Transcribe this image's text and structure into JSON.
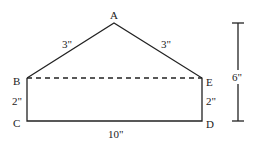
{
  "figure": {
    "vertices": [
      {
        "label": "A",
        "x": 114,
        "y": 23
      },
      {
        "label": "B",
        "x": 27,
        "y": 78
      },
      {
        "label": "C",
        "x": 27,
        "y": 121
      },
      {
        "label": "D",
        "x": 202,
        "y": 121
      },
      {
        "label": "E",
        "x": 202,
        "y": 78
      }
    ],
    "labels": {
      "A": "A",
      "B": "B",
      "C": "C",
      "D": "D",
      "E": "E",
      "AB": "3\"",
      "AE": "3\"",
      "BC": "2\"",
      "ED": "2\"",
      "CD": "10\"",
      "height": "6\""
    },
    "line_color": "#222222"
  }
}
